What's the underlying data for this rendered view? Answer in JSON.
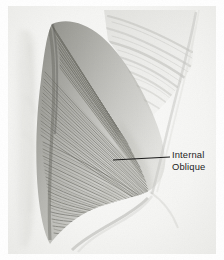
{
  "figure": {
    "domain": "anatomical-illustration",
    "medium": "graphite-pencil-drawing",
    "view": "lateral oblique view of torso, right side",
    "width": 224,
    "height": 260
  },
  "background": {
    "page_color": "#ffffff",
    "paper_tone": "#f6f6f5",
    "vignette_tone": "#ececea"
  },
  "palette": {
    "fiber_dark": "#5e5e5c",
    "fiber_mid": "#8c8c8a",
    "fiber_light": "#b8b8b5",
    "rib_shade": "#c9c9c6",
    "contour_line": "#b0b0ad",
    "label_text": "#1d1d1d",
    "leader_line": "#1a1a1a"
  },
  "annotations": [
    {
      "id": "internal-oblique",
      "lines": [
        "Internal",
        "Oblique"
      ],
      "text_x": 172,
      "text_y": 149,
      "font_size_px": 9.4,
      "leader": {
        "from_x": 113,
        "from_y": 160,
        "to_x": 170,
        "to_y": 157,
        "stroke": "#1a1a1a",
        "width": 1.05
      }
    }
  ],
  "regions": [
    {
      "name": "internal-oblique-fiber-fan",
      "description": "Dense diagonal muscle fibers fanning from superior-lateral origin down and anteriorly to the inferior iliac attachment",
      "fiber_direction": "superolateral to inferomedial",
      "tone_range": [
        "#5e5e5c",
        "#b8b8b5"
      ]
    },
    {
      "name": "costal-rib-striations",
      "description": "Faint oblique rib and intercostal striations in the upper right quadrant",
      "tone": "#c9c9c6"
    },
    {
      "name": "rectus-abdominis-band",
      "description": "Pale vertical band along the left margin representing the rectus sheath",
      "tone": "#e6e6e4"
    },
    {
      "name": "iliac-crest-contour",
      "description": "Light curved boundary sweeping from lower center to lower right, the iliac crest and inguinal region",
      "tone": "#cfcfcc"
    },
    {
      "name": "torso-contour",
      "description": "Flank silhouette descending from upper right to the lower right hip",
      "tone": "#b0b0ad"
    }
  ],
  "chart_data": {
    "type": "table",
    "title": "Internal Oblique",
    "labels": [
      "Internal",
      "Oblique"
    ]
  }
}
